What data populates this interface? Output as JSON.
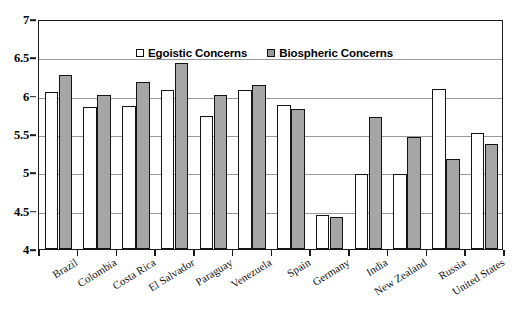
{
  "chart_data": {
    "type": "bar",
    "title": "",
    "subtitle": "",
    "xlabel": "",
    "ylabel": "",
    "ylim": [
      4,
      7
    ],
    "ytick_labels": [
      "7",
      "6.5",
      "6",
      "5.5",
      "5",
      "4.5",
      "4"
    ],
    "yticks": [
      7,
      6.5,
      6,
      5.5,
      5,
      4.5,
      4
    ],
    "grid": true,
    "legend_position": "top-center",
    "categories": [
      "Brazil",
      "Colombia",
      "Costa Rica",
      "El Salvador",
      "Paraguay",
      "Venezuela",
      "Spain",
      "Germany",
      "India",
      "New Zealand",
      "Russia",
      "United States"
    ],
    "series": [
      {
        "name": "Egoistic Concerns",
        "color": "#ffffff",
        "values": [
          6.05,
          5.85,
          5.86,
          6.08,
          5.73,
          6.08,
          5.88,
          4.45,
          4.98,
          4.98,
          6.09,
          5.51
        ]
      },
      {
        "name": "Biospheric Concerns",
        "color": "#a6a6a6",
        "values": [
          6.27,
          6.01,
          6.18,
          6.43,
          6.01,
          6.14,
          5.83,
          4.42,
          5.72,
          5.46,
          5.17,
          5.37
        ]
      }
    ]
  },
  "legend": {
    "entries": [
      {
        "label": "Egoistic Concerns",
        "swatch": "white-square-swatch"
      },
      {
        "label": "Biospheric Concerns",
        "swatch": "gray-square-swatch"
      }
    ]
  }
}
